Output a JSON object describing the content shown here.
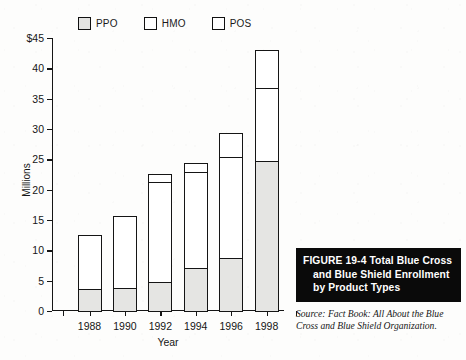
{
  "figure": {
    "caption_line1": "FIGURE 19-4  Total Blue Cross",
    "caption_line2": "and Blue Shield Enrollment",
    "caption_line3": "by Product Types",
    "source": "Source:  Fact Book: All About the Blue Cross and Blue Shield Organization."
  },
  "colors": {
    "ppo_fill": "#e5e5e3",
    "hmo_fill": "#ffffff",
    "pos_fill": "#ffffff",
    "stroke": "#151515",
    "caption_bg": "#0a0a0a",
    "caption_fg": "#ffffff",
    "paper": "#fdfdfc"
  },
  "chart_data": {
    "type": "bar",
    "stacked": true,
    "title": "",
    "xlabel": "Year",
    "ylabel": "Millions",
    "ylim": [
      0,
      45
    ],
    "yticks": [
      0,
      5,
      10,
      15,
      20,
      25,
      30,
      35,
      40,
      45
    ],
    "ytick_labels": [
      "0",
      "5",
      "10",
      "15",
      "20",
      "25",
      "30",
      "35",
      "40",
      "$45"
    ],
    "grid": false,
    "legend_position": "top",
    "categories": [
      "1988",
      "1990",
      "1992",
      "1994",
      "1996",
      "1998"
    ],
    "series": [
      {
        "name": "PPO",
        "values": [
          3.9,
          4.1,
          5.0,
          7.4,
          8.9,
          25.0
        ]
      },
      {
        "name": "HMO",
        "values": [
          9.1,
          12.1,
          16.7,
          15.9,
          17.0,
          12.3
        ]
      },
      {
        "name": "POS",
        "values": [
          0,
          0,
          1.5,
          1.8,
          4.1,
          6.4
        ]
      }
    ],
    "totals": [
      13.0,
      16.2,
      23.2,
      25.1,
      30.0,
      43.7
    ]
  },
  "legend": {
    "items": [
      {
        "label": "PPO",
        "key": "ppo"
      },
      {
        "label": "HMO",
        "key": "hmo"
      },
      {
        "label": "POS",
        "key": "pos"
      }
    ]
  }
}
